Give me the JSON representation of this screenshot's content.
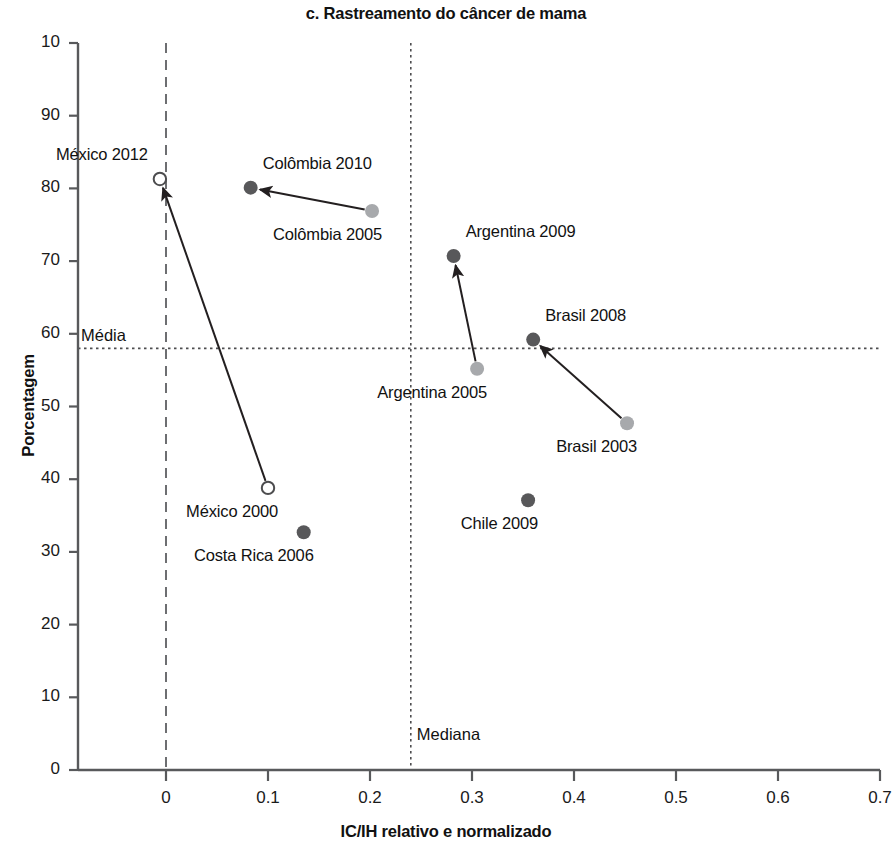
{
  "chart_data": {
    "type": "scatter",
    "title": "c. Rastreamento do câncer de mama",
    "xlabel": "IC/IH relativo e normalizado",
    "ylabel": "Porcentagem",
    "xlim": [
      -0.07,
      0.7
    ],
    "ylim": [
      0,
      100
    ],
    "xticks": [
      "0",
      "0.1",
      "0.2",
      "0.3",
      "0.4",
      "0.5",
      "0.6",
      "0.7"
    ],
    "xtick_values": [
      0,
      0.1,
      0.2,
      0.3,
      0.4,
      0.5,
      0.6,
      0.7
    ],
    "yticks": [
      "0",
      "10",
      "20",
      "30",
      "40",
      "50",
      "60",
      "70",
      "80",
      "90",
      "10"
    ],
    "ytick_values": [
      0,
      10,
      20,
      30,
      40,
      50,
      60,
      70,
      80,
      90,
      100
    ],
    "grid": false,
    "legend": "none",
    "colors": {
      "dark_marker": "#58585a",
      "light_marker": "#a7a9ac",
      "open_marker": "#ffffff",
      "axis": "#58595b",
      "arrow": "#231f20"
    },
    "reference_lines": [
      {
        "name": "Média",
        "label": "Média",
        "orientation": "horizontal",
        "value": 58,
        "style": "dotted"
      },
      {
        "name": "Mediana",
        "label": "Mediana",
        "orientation": "vertical",
        "value": 0.24,
        "style": "dotted"
      },
      {
        "name": "zero-vertical",
        "label": "",
        "orientation": "vertical",
        "value": 0,
        "style": "dashed"
      },
      {
        "name": "zero-horizontal",
        "label": "",
        "orientation": "horizontal",
        "value": 0,
        "style": "dashed"
      }
    ],
    "points": [
      {
        "name": "México 2012",
        "x": -0.006,
        "y": 81.3,
        "marker": "open",
        "label": "México 2012",
        "label_pos": "up-left"
      },
      {
        "name": "México 2000",
        "x": 0.1,
        "y": 38.8,
        "marker": "open",
        "label": "México 2000",
        "label_pos": "down-left"
      },
      {
        "name": "Colômbia 2010",
        "x": 0.083,
        "y": 80.1,
        "marker": "dark",
        "label": "Colômbia 2010",
        "label_pos": "up-right"
      },
      {
        "name": "Colômbia 2005",
        "x": 0.202,
        "y": 76.9,
        "marker": "light",
        "label": "Colômbia 2005",
        "label_pos": "down-left"
      },
      {
        "name": "Argentina 2009",
        "x": 0.282,
        "y": 70.7,
        "marker": "dark",
        "label": "Argentina 2009",
        "label_pos": "up-right"
      },
      {
        "name": "Argentina 2005",
        "x": 0.305,
        "y": 55.2,
        "marker": "light",
        "label": "Argentina 2005",
        "label_pos": "down-left"
      },
      {
        "name": "Brasil 2008",
        "x": 0.36,
        "y": 59.2,
        "marker": "dark",
        "label": "Brasil 2008",
        "label_pos": "up-right"
      },
      {
        "name": "Brasil 2003",
        "x": 0.452,
        "y": 47.7,
        "marker": "light",
        "label": "Brasil 2003",
        "label_pos": "down-left"
      },
      {
        "name": "Chile 2009",
        "x": 0.355,
        "y": 37.1,
        "marker": "dark",
        "label": "Chile 2009",
        "label_pos": "down-left"
      },
      {
        "name": "Costa Rica 2006",
        "x": 0.135,
        "y": 32.7,
        "marker": "dark",
        "label": "Costa Rica 2006",
        "label_pos": "down-left"
      }
    ],
    "arrows": [
      {
        "name": "mexico-arrow",
        "from": "México 2000",
        "to": "México 2012"
      },
      {
        "name": "colombia-arrow",
        "from": "Colômbia 2005",
        "to": "Colômbia 2010"
      },
      {
        "name": "argentina-arrow",
        "from": "Argentina 2005",
        "to": "Argentina 2009"
      },
      {
        "name": "brasil-arrow",
        "from": "Brasil 2003",
        "to": "Brasil 2008"
      }
    ]
  }
}
